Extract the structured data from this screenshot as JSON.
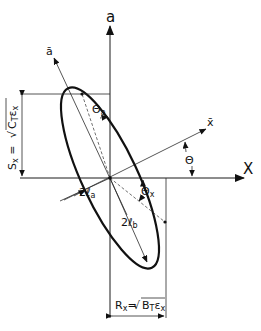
{
  "diagram": {
    "type": "phase-space ellipse",
    "axes": {
      "vertical_label": "a",
      "horizontal_label": "X",
      "rotated_vertical_label": "ā",
      "rotated_horizontal_label": "x̄"
    },
    "angles": {
      "theta": "Θ",
      "theta_a": "Θ",
      "theta_a_sub": "a",
      "theta_x": "Θ",
      "theta_x_sub": "x"
    },
    "semi_axes": {
      "minor_prefix": "2ℓ",
      "minor_sub": "a",
      "major_prefix": "2ℓ",
      "major_sub": "b"
    },
    "dimensions": {
      "sx_label": "S",
      "sx_sub": "x",
      "sx_eq": " = ",
      "sx_radicand": "C",
      "sx_radicand_sub": "T",
      "sx_eps": "ε",
      "sx_eps_sub": "x",
      "rx_label": "R",
      "rx_sub": "x",
      "rx_eq": "=",
      "rx_radicand": "B",
      "rx_radicand_sub": "T",
      "rx_eps": "ε",
      "rx_eps_sub": "x"
    },
    "colors": {
      "ink": "#111111",
      "background": "#ffffff"
    }
  }
}
